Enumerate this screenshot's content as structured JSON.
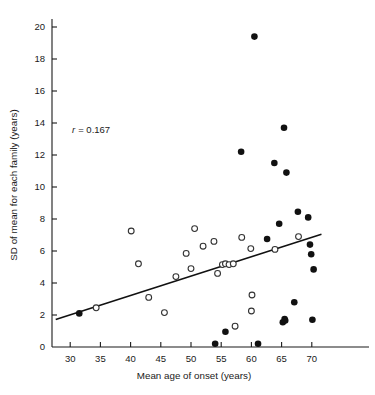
{
  "figure": {
    "annotation": "r = 0.167",
    "annotation_symbol": "r",
    "annotation_value": "= 0.167"
  },
  "chart_data": {
    "type": "scatter",
    "title": "",
    "xlabel": "Mean age of onset (years)",
    "ylabel": "SD of mean for each family (years)",
    "xlim": [
      27.5,
      74
    ],
    "ylim": [
      0,
      20.8
    ],
    "xticks": [
      30,
      35,
      40,
      45,
      50,
      55,
      60,
      65,
      70
    ],
    "yticks": [
      0,
      2,
      4,
      6,
      8,
      10,
      12,
      14,
      16,
      18,
      20
    ],
    "grid": false,
    "legend": null,
    "annotations": [
      {
        "text": "r = 0.167",
        "x": 38.5,
        "y": 13.6
      }
    ],
    "series": [
      {
        "name": "open-circles",
        "marker": "open-circle",
        "color": "#ffffff",
        "edge_color": "#333333",
        "points": [
          [
            34.3,
            2.45
          ],
          [
            40.1,
            7.25
          ],
          [
            41.3,
            5.2
          ],
          [
            43.0,
            3.1
          ],
          [
            45.6,
            2.15
          ],
          [
            47.5,
            4.4
          ],
          [
            49.2,
            5.85
          ],
          [
            50.0,
            4.9
          ],
          [
            50.6,
            7.4
          ],
          [
            52.0,
            6.3
          ],
          [
            53.8,
            6.6
          ],
          [
            54.4,
            4.6
          ],
          [
            55.2,
            5.15
          ],
          [
            55.7,
            5.2
          ],
          [
            56.3,
            5.15
          ],
          [
            57.0,
            5.2
          ],
          [
            57.3,
            1.3
          ],
          [
            58.4,
            6.85
          ],
          [
            59.9,
            6.15
          ],
          [
            60.1,
            3.25
          ],
          [
            60.0,
            2.25
          ],
          [
            63.9,
            6.1
          ],
          [
            67.8,
            6.9
          ]
        ]
      },
      {
        "name": "filled-circles",
        "marker": "filled-circle",
        "color": "#111111",
        "points": [
          [
            31.5,
            2.1
          ],
          [
            54.0,
            0.2
          ],
          [
            55.7,
            0.95
          ],
          [
            60.5,
            19.4
          ],
          [
            58.3,
            12.2
          ],
          [
            61.1,
            0.2
          ],
          [
            62.6,
            6.75
          ],
          [
            63.8,
            11.5
          ],
          [
            64.6,
            7.7
          ],
          [
            65.4,
            13.7
          ],
          [
            65.2,
            1.55
          ],
          [
            65.5,
            1.75
          ],
          [
            65.6,
            1.65
          ],
          [
            65.8,
            10.9
          ],
          [
            67.1,
            2.8
          ],
          [
            67.7,
            8.45
          ],
          [
            69.4,
            8.1
          ],
          [
            69.7,
            6.4
          ],
          [
            69.9,
            5.8
          ],
          [
            70.1,
            1.7
          ],
          [
            70.3,
            4.85
          ]
        ]
      }
    ],
    "fit_line": {
      "name": "regression-line",
      "x": [
        27.6,
        71.6
      ],
      "y": [
        1.72,
        7.05
      ],
      "color": "#111111"
    }
  }
}
